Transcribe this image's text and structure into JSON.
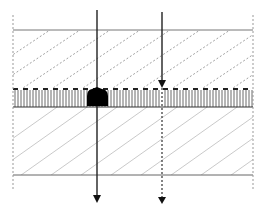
{
  "diagram": {
    "type": "layered cross-section with penetrating rays",
    "width": 266,
    "height": 212,
    "colors": {
      "background": "#ffffff",
      "line": "#555555",
      "dark": "#111111",
      "hatch_upper": "#888888",
      "hatch_lower": "#bbbbbb",
      "border_dashed": "#999999"
    },
    "layers": [
      {
        "name": "upper-layer",
        "pattern": "dashed-diagonal-hatch",
        "y_top": 30,
        "y_bottom": 88
      },
      {
        "name": "middle-layer",
        "pattern": "vertical-lines",
        "y_top": 88,
        "y_bottom": 107
      },
      {
        "name": "lower-layer",
        "pattern": "light-diagonal-hatch",
        "y_top": 107,
        "y_bottom": 175
      }
    ],
    "rays": [
      {
        "name": "ray-left",
        "x": 97,
        "y_start": 10,
        "y_end": 202,
        "style": "solid",
        "has_absorber_blob": true
      },
      {
        "name": "ray-right",
        "x": 162,
        "y_start": 12,
        "y_break": 88,
        "y_end": 202,
        "style_above": "solid",
        "style_below": "dotted"
      }
    ],
    "labels": []
  }
}
